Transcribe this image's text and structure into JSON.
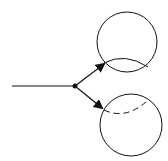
{
  "diagram": {
    "colors": {
      "stroke": "#111111",
      "background": "#ffffff"
    },
    "incoming_line": {
      "x1": 12,
      "y1": 86,
      "x2": 75,
      "y2": 86
    },
    "node": {
      "cx": 75,
      "cy": 86,
      "r": 2.5
    },
    "arrows": [
      {
        "name": "upper",
        "x1": 75,
        "y1": 86,
        "x2": 104,
        "y2": 64
      },
      {
        "name": "lower",
        "x1": 75,
        "y1": 86,
        "x2": 102,
        "y2": 108
      }
    ],
    "circles": [
      {
        "name": "upper-circle",
        "cx": 127,
        "cy": 42,
        "r": 30,
        "inner_arc": "solid"
      },
      {
        "name": "lower-circle",
        "cx": 131,
        "cy": 125,
        "r": 31,
        "inner_arc": "dashed"
      }
    ]
  }
}
